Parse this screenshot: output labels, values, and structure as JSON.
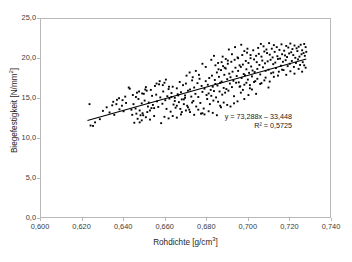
{
  "chart_data": {
    "type": "scatter",
    "title": "",
    "xlabel": "Rohdichte [g/cm3]",
    "xlabel_base": "Rohdichte [g/cm",
    "xlabel_exp": "3",
    "xlabel_tail": "]",
    "ylabel": "Biegefestigkeit [N/mm2]",
    "ylabel_base": "Biegefestigkeit [N/mm",
    "ylabel_exp": "2",
    "ylabel_tail": "]",
    "xlim": [
      0.6,
      0.74
    ],
    "ylim": [
      0.0,
      25.0
    ],
    "xticks": [
      "0,600",
      "0,620",
      "0,640",
      "0,660",
      "0,680",
      "0,700",
      "0,720",
      "0,740"
    ],
    "xtick_values": [
      0.6,
      0.62,
      0.64,
      0.66,
      0.68,
      0.7,
      0.72,
      0.74
    ],
    "yticks": [
      "0,0",
      "5,0",
      "10,0",
      "15,0",
      "20,0",
      "25,0"
    ],
    "ytick_values": [
      0.0,
      5.0,
      10.0,
      15.0,
      20.0,
      25.0
    ],
    "grid": false,
    "legend": false,
    "marker": "filled-square",
    "marker_color": "#000000",
    "marker_size": 1.9,
    "trendline": {
      "type": "linear",
      "slope": 73.288,
      "intercept": -33.448,
      "r_squared": 0.5725,
      "equation_text": "y = 73,288x – 33,448",
      "r2_text": "R² = 0,5725",
      "color": "#000000",
      "x_start": 0.6225,
      "x_end": 0.7285
    },
    "n_points": 352,
    "points": [
      [
        0.6235,
        14.25
      ],
      [
        0.624,
        11.55
      ],
      [
        0.6252,
        11.5
      ],
      [
        0.6262,
        11.95
      ],
      [
        0.6285,
        12.35
      ],
      [
        0.63,
        13.4
      ],
      [
        0.6318,
        13.85
      ],
      [
        0.6332,
        13.2
      ],
      [
        0.6345,
        14.1
      ],
      [
        0.6355,
        12.9
      ],
      [
        0.6368,
        14.8
      ],
      [
        0.638,
        13.6
      ],
      [
        0.6392,
        14.05
      ],
      [
        0.64,
        13.35
      ],
      [
        0.6412,
        14.4
      ],
      [
        0.6425,
        16.35
      ],
      [
        0.643,
        16.2
      ],
      [
        0.6438,
        13.55
      ],
      [
        0.6442,
        12.9
      ],
      [
        0.6448,
        14.25
      ],
      [
        0.6452,
        11.9
      ],
      [
        0.6458,
        13.7
      ],
      [
        0.6465,
        15.7
      ],
      [
        0.6472,
        14.9
      ],
      [
        0.6478,
        11.95
      ],
      [
        0.6482,
        12.85
      ],
      [
        0.6488,
        14.35
      ],
      [
        0.6492,
        13.1
      ],
      [
        0.6498,
        15.55
      ],
      [
        0.6502,
        14.7
      ],
      [
        0.6508,
        16.4
      ],
      [
        0.6512,
        15.95
      ],
      [
        0.6518,
        13.95
      ],
      [
        0.6522,
        14.45
      ],
      [
        0.6528,
        13.45
      ],
      [
        0.6532,
        16.05
      ],
      [
        0.6538,
        15.3
      ],
      [
        0.6542,
        14.15
      ],
      [
        0.6548,
        13.75
      ],
      [
        0.6552,
        16.55
      ],
      [
        0.6558,
        15.45
      ],
      [
        0.6562,
        14.6
      ],
      [
        0.6568,
        13.9
      ],
      [
        0.6572,
        16.75
      ],
      [
        0.6578,
        15.1
      ],
      [
        0.6582,
        11.85
      ],
      [
        0.6588,
        14.3
      ],
      [
        0.6592,
        15.85
      ],
      [
        0.6598,
        16.95
      ],
      [
        0.6602,
        14.75
      ],
      [
        0.6608,
        13.65
      ],
      [
        0.6612,
        15.25
      ],
      [
        0.6618,
        16.15
      ],
      [
        0.6622,
        14.95
      ],
      [
        0.6628,
        13.3
      ],
      [
        0.6632,
        15.65
      ],
      [
        0.6638,
        16.45
      ],
      [
        0.6642,
        14.2
      ],
      [
        0.6648,
        15.05
      ],
      [
        0.6652,
        13.8
      ],
      [
        0.6658,
        16.25
      ],
      [
        0.6662,
        15.5
      ],
      [
        0.6668,
        14.5
      ],
      [
        0.6672,
        17.05
      ],
      [
        0.6678,
        15.75
      ],
      [
        0.6682,
        13.25
      ],
      [
        0.6688,
        16.65
      ],
      [
        0.6692,
        14.85
      ],
      [
        0.6698,
        15.35
      ],
      [
        0.6702,
        16.85
      ],
      [
        0.6708,
        14.05
      ],
      [
        0.6712,
        15.95
      ],
      [
        0.6718,
        13.55
      ],
      [
        0.6722,
        16.1
      ],
      [
        0.6728,
        15.2
      ],
      [
        0.6732,
        17.25
      ],
      [
        0.6738,
        14.65
      ],
      [
        0.6742,
        16.35
      ],
      [
        0.6748,
        15.55
      ],
      [
        0.6752,
        13.95
      ],
      [
        0.6758,
        16.9
      ],
      [
        0.6762,
        15.15
      ],
      [
        0.6768,
        17.45
      ],
      [
        0.6772,
        14.4
      ],
      [
        0.6778,
        16.55
      ],
      [
        0.6782,
        15.8
      ],
      [
        0.6788,
        13.7
      ],
      [
        0.6792,
        16.2
      ],
      [
        0.6798,
        17.15
      ],
      [
        0.6802,
        15.4
      ],
      [
        0.6805,
        14.9
      ],
      [
        0.6808,
        16.7
      ],
      [
        0.6812,
        15.6
      ],
      [
        0.6815,
        17.55
      ],
      [
        0.6818,
        14.25
      ],
      [
        0.6822,
        16.05
      ],
      [
        0.6825,
        15.3
      ],
      [
        0.6828,
        17.85
      ],
      [
        0.6832,
        16.45
      ],
      [
        0.6835,
        14.7
      ],
      [
        0.6838,
        15.9
      ],
      [
        0.6842,
        17.3
      ],
      [
        0.6845,
        16.8
      ],
      [
        0.6848,
        15.1
      ],
      [
        0.6852,
        18.25
      ],
      [
        0.6855,
        16.6
      ],
      [
        0.6858,
        14.55
      ],
      [
        0.6862,
        17.7
      ],
      [
        0.6865,
        15.85
      ],
      [
        0.6868,
        16.95
      ],
      [
        0.6872,
        18.55
      ],
      [
        0.6875,
        17.1
      ],
      [
        0.6878,
        15.45
      ],
      [
        0.6882,
        19.05
      ],
      [
        0.6885,
        16.3
      ],
      [
        0.6888,
        17.95
      ],
      [
        0.6892,
        15.7
      ],
      [
        0.6895,
        18.75
      ],
      [
        0.6898,
        16.15
      ],
      [
        0.6902,
        17.4
      ],
      [
        0.6905,
        19.35
      ],
      [
        0.6908,
        15.95
      ],
      [
        0.6912,
        18.1
      ],
      [
        0.6915,
        16.85
      ],
      [
        0.6918,
        17.65
      ],
      [
        0.6922,
        19.6
      ],
      [
        0.6925,
        16.4
      ],
      [
        0.6928,
        18.35
      ],
      [
        0.6932,
        17.2
      ],
      [
        0.6935,
        15.25
      ],
      [
        0.6938,
        19.85
      ],
      [
        0.6942,
        18.85
      ],
      [
        0.6945,
        16.95
      ],
      [
        0.6948,
        17.8
      ],
      [
        0.6952,
        20.15
      ],
      [
        0.6955,
        18.45
      ],
      [
        0.6958,
        17.0
      ],
      [
        0.6962,
        19.15
      ],
      [
        0.6965,
        16.5
      ],
      [
        0.6968,
        18.95
      ],
      [
        0.6972,
        17.55
      ],
      [
        0.6975,
        20.45
      ],
      [
        0.6978,
        19.25
      ],
      [
        0.6982,
        18.05
      ],
      [
        0.6985,
        16.7
      ],
      [
        0.6988,
        17.9
      ],
      [
        0.6992,
        19.7
      ],
      [
        0.6995,
        18.65
      ],
      [
        0.6998,
        20.75
      ],
      [
        0.7002,
        17.35
      ],
      [
        0.7005,
        19.45
      ],
      [
        0.7008,
        18.2
      ],
      [
        0.7012,
        16.25
      ],
      [
        0.7015,
        20.05
      ],
      [
        0.7018,
        19.0
      ],
      [
        0.7022,
        17.75
      ],
      [
        0.7025,
        18.5
      ],
      [
        0.7028,
        21.05
      ],
      [
        0.7032,
        19.9
      ],
      [
        0.7035,
        18.3
      ],
      [
        0.7038,
        17.15
      ],
      [
        0.7042,
        20.35
      ],
      [
        0.7045,
        19.55
      ],
      [
        0.7048,
        18.7
      ],
      [
        0.7052,
        21.35
      ],
      [
        0.7055,
        20.6
      ],
      [
        0.7058,
        19.2
      ],
      [
        0.7062,
        18.0
      ],
      [
        0.7065,
        21.85
      ],
      [
        0.7068,
        20.25
      ],
      [
        0.7072,
        19.75
      ],
      [
        0.7075,
        18.9
      ],
      [
        0.7078,
        21.55
      ],
      [
        0.7082,
        20.9
      ],
      [
        0.7085,
        19.4
      ],
      [
        0.7088,
        18.45
      ],
      [
        0.7092,
        21.15
      ],
      [
        0.7095,
        20.7
      ],
      [
        0.7098,
        19.65
      ],
      [
        0.7102,
        18.6
      ],
      [
        0.7105,
        21.95
      ],
      [
        0.7108,
        20.5
      ],
      [
        0.7112,
        19.85
      ],
      [
        0.7115,
        18.15
      ],
      [
        0.7118,
        21.25
      ],
      [
        0.7122,
        20.15
      ],
      [
        0.7125,
        19.3
      ],
      [
        0.7128,
        21.7
      ],
      [
        0.7132,
        20.85
      ],
      [
        0.7135,
        19.5
      ],
      [
        0.7138,
        18.8
      ],
      [
        0.7142,
        21.45
      ],
      [
        0.7145,
        20.3
      ],
      [
        0.7148,
        19.95
      ],
      [
        0.7152,
        18.35
      ],
      [
        0.7155,
        21.1
      ],
      [
        0.7158,
        20.0
      ],
      [
        0.7162,
        19.1
      ],
      [
        0.7165,
        21.8
      ],
      [
        0.7168,
        20.55
      ],
      [
        0.7172,
        19.6
      ],
      [
        0.7175,
        18.55
      ],
      [
        0.7178,
        21.0
      ],
      [
        0.7182,
        20.4
      ],
      [
        0.7185,
        19.8
      ],
      [
        0.7188,
        21.6
      ],
      [
        0.7192,
        20.2
      ],
      [
        0.7195,
        19.05
      ],
      [
        0.7198,
        21.4
      ],
      [
        0.7202,
        20.65
      ],
      [
        0.7205,
        19.35
      ],
      [
        0.7208,
        21.9
      ],
      [
        0.7212,
        20.8
      ],
      [
        0.7215,
        19.7
      ],
      [
        0.7218,
        21.2
      ],
      [
        0.7222,
        20.45
      ],
      [
        0.7225,
        18.95
      ],
      [
        0.7228,
        21.65
      ],
      [
        0.7232,
        20.1
      ],
      [
        0.7235,
        19.45
      ],
      [
        0.7238,
        21.3
      ],
      [
        0.7242,
        20.95
      ],
      [
        0.7245,
        19.9
      ],
      [
        0.7248,
        21.5
      ],
      [
        0.7252,
        20.25
      ],
      [
        0.7255,
        19.2
      ],
      [
        0.7258,
        21.75
      ],
      [
        0.7262,
        20.55
      ],
      [
        0.7265,
        21.05
      ],
      [
        0.7268,
        19.55
      ],
      [
        0.7272,
        20.7
      ],
      [
        0.7275,
        21.85
      ],
      [
        0.7278,
        20.35
      ],
      [
        0.7282,
        21.45
      ],
      [
        0.7285,
        20.85
      ],
      [
        0.6868,
        14.05
      ],
      [
        0.6872,
        13.85
      ],
      [
        0.6885,
        14.45
      ],
      [
        0.6902,
        14.15
      ],
      [
        0.6918,
        13.95
      ],
      [
        0.6935,
        14.35
      ],
      [
        0.6952,
        14.6
      ],
      [
        0.6968,
        15.7
      ],
      [
        0.6985,
        14.9
      ],
      [
        0.7005,
        15.4
      ],
      [
        0.7022,
        16.1
      ],
      [
        0.7042,
        15.55
      ],
      [
        0.7062,
        16.8
      ],
      [
        0.7082,
        17.25
      ],
      [
        0.7102,
        16.35
      ],
      [
        0.6775,
        13.05
      ],
      [
        0.6792,
        12.95
      ],
      [
        0.6812,
        13.35
      ],
      [
        0.6832,
        13.15
      ],
      [
        0.6852,
        12.85
      ],
      [
        0.6598,
        12.65
      ],
      [
        0.6618,
        12.45
      ],
      [
        0.6638,
        12.75
      ],
      [
        0.6658,
        12.55
      ],
      [
        0.6678,
        12.95
      ],
      [
        0.6702,
        13.45
      ],
      [
        0.6722,
        13.25
      ],
      [
        0.6742,
        12.9
      ],
      [
        0.6762,
        13.55
      ],
      [
        0.6782,
        13.1
      ],
      [
        0.6468,
        12.4
      ],
      [
        0.6488,
        12.2
      ],
      [
        0.6508,
        12.6
      ],
      [
        0.6528,
        12.3
      ],
      [
        0.6548,
        12.75
      ],
      [
        0.688,
        20.25
      ],
      [
        0.6895,
        19.95
      ],
      [
        0.691,
        21.15
      ],
      [
        0.6925,
        20.55
      ],
      [
        0.694,
        21.45
      ],
      [
        0.6955,
        20.05
      ],
      [
        0.697,
        21.75
      ],
      [
        0.6985,
        20.95
      ],
      [
        0.7,
        21.25
      ],
      [
        0.7015,
        20.45
      ],
      [
        0.6845,
        19.15
      ],
      [
        0.686,
        18.65
      ],
      [
        0.6875,
        19.55
      ],
      [
        0.689,
        18.85
      ],
      [
        0.6905,
        19.75
      ],
      [
        0.6705,
        17.85
      ],
      [
        0.672,
        18.25
      ],
      [
        0.6735,
        17.65
      ],
      [
        0.675,
        18.45
      ],
      [
        0.6765,
        17.95
      ],
      [
        0.656,
        16.85
      ],
      [
        0.6575,
        17.15
      ],
      [
        0.659,
        16.65
      ],
      [
        0.6605,
        17.35
      ],
      [
        0.662,
        16.45
      ],
      [
        0.6445,
        15.4
      ],
      [
        0.646,
        15.15
      ],
      [
        0.6475,
        15.85
      ],
      [
        0.649,
        15.6
      ],
      [
        0.6505,
        16.1
      ],
      [
        0.635,
        14.55
      ],
      [
        0.6365,
        14.25
      ],
      [
        0.6378,
        15.0
      ],
      [
        0.6395,
        14.75
      ],
      [
        0.6408,
        15.2
      ],
      [
        0.7125,
        18.25
      ],
      [
        0.7148,
        17.85
      ],
      [
        0.7168,
        18.6
      ],
      [
        0.7188,
        17.95
      ],
      [
        0.7208,
        18.4
      ],
      [
        0.7228,
        18.1
      ],
      [
        0.7248,
        18.7
      ],
      [
        0.7265,
        18.35
      ],
      [
        0.7275,
        19.15
      ],
      [
        0.7282,
        18.85
      ],
      [
        0.6658,
        14.05
      ],
      [
        0.6675,
        13.65
      ],
      [
        0.6692,
        14.25
      ],
      [
        0.6712,
        13.85
      ],
      [
        0.6732,
        14.45
      ],
      [
        0.6462,
        13.05
      ],
      [
        0.6478,
        13.45
      ],
      [
        0.6495,
        12.85
      ],
      [
        0.6515,
        13.25
      ],
      [
        0.6535,
        13.75
      ],
      [
        0.6962,
        16.45
      ],
      [
        0.6978,
        16.05
      ],
      [
        0.6995,
        16.95
      ],
      [
        0.7012,
        16.65
      ],
      [
        0.7032,
        17.05
      ],
      [
        0.7048,
        17.45
      ],
      [
        0.7068,
        16.9
      ],
      [
        0.7088,
        17.6
      ],
      [
        0.7108,
        17.1
      ],
      [
        0.7128,
        17.7
      ],
      [
        0.6825,
        19.85
      ],
      [
        0.6838,
        20.35
      ],
      [
        0.6858,
        19.45
      ],
      [
        0.6798,
        18.95
      ],
      [
        0.6782,
        19.35
      ],
      [
        0.6698,
        15.05
      ],
      [
        0.6682,
        14.85
      ],
      [
        0.6665,
        15.35
      ],
      [
        0.6648,
        14.65
      ],
      [
        0.6632,
        15.15
      ]
    ]
  }
}
